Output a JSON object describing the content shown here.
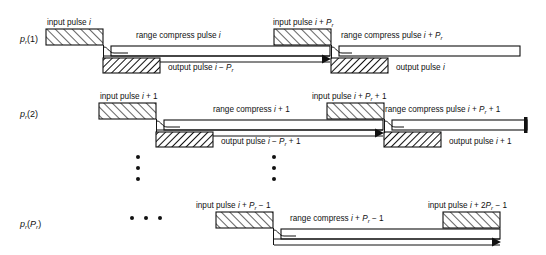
{
  "figure": {
    "title": "",
    "type": "radar-pulse-timing-diagram",
    "colors": {
      "stroke": "#111111",
      "background": "#ffffff",
      "hatch": "#111111"
    }
  },
  "rows": [
    {
      "id": "row-1",
      "label_main": "p",
      "label_sub": "r",
      "label_arg": "(1)",
      "input_pulses": [
        {
          "text_prefix": "input pulse ",
          "text_var": "i",
          "text_suffix": ""
        },
        {
          "text_prefix": "input pulse ",
          "text_var": "i",
          "text_suffix": " + P",
          "text_sub": "r"
        }
      ],
      "range_compress": [
        {
          "text": "range compress pulse ",
          "var": "i",
          "suffix": ""
        },
        {
          "text": "range compress pulse ",
          "var": "i",
          "suffix": " + P",
          "sub": "r"
        }
      ],
      "output_pulses": [
        {
          "text": "output pulse ",
          "var": "i",
          "suffix": " − P",
          "sub": "r"
        },
        {
          "text": "output pulse ",
          "var": "i",
          "suffix": ""
        }
      ]
    },
    {
      "id": "row-2",
      "label_main": "p",
      "label_sub": "r",
      "label_arg": "(2)",
      "input_pulses": [
        {
          "text_prefix": "input pulse ",
          "text_var": "i",
          "text_suffix": " + 1"
        },
        {
          "text_prefix": "input pulse ",
          "text_var": "i",
          "text_suffix": " + P",
          "text_sub": "r",
          "text_tail": " + 1"
        }
      ],
      "range_compress": [
        {
          "text": "range compress ",
          "var": "i",
          "suffix": " + 1"
        },
        {
          "text": "range compress pulse ",
          "var": "i",
          "suffix": " + P",
          "sub": "r",
          "tail": " + 1"
        }
      ],
      "output_pulses": [
        {
          "text": "output pulse ",
          "var": "i",
          "suffix": " − P",
          "sub": "r",
          "tail": " + 1"
        },
        {
          "text": "output pulse ",
          "var": "i",
          "suffix": " + 1"
        }
      ]
    },
    {
      "id": "row-3",
      "label_main": "p",
      "label_sub": "r",
      "label_arg": "(P",
      "label_arg_sub": "r",
      "label_arg_close": ")",
      "input_pulses": [
        {
          "text_prefix": "input pulse ",
          "text_var": "i",
          "text_suffix": " + P",
          "text_sub": "r",
          "text_tail": " − 1"
        },
        {
          "text_prefix": "input pulse ",
          "text_var": "i",
          "text_suffix": " + 2P",
          "text_sub": "r",
          "text_tail": " − 1"
        }
      ],
      "range_compress": [
        {
          "text": "range compress ",
          "var": "i",
          "suffix": " + P",
          "sub": "r",
          "tail": " − 1"
        }
      ],
      "output_pulses": []
    }
  ],
  "ellipsis": {
    "vertical_columns": [
      {
        "x": 138,
        "ys": [
          157,
          168,
          179
        ]
      },
      {
        "x": 274,
        "ys": [
          157,
          168,
          179
        ]
      }
    ],
    "horizontal_dots": {
      "y": 218,
      "xs": [
        132,
        146,
        160
      ]
    }
  },
  "text_strings": {
    "row1": {
      "input_left": "input pulse i",
      "input_right": "input pulse i + Pr",
      "rc_left": "range compress pulse i",
      "rc_right": "range compress pulse i + Pr",
      "out_left": "output pulse i − Pr",
      "out_right": "output pulse i"
    },
    "row2": {
      "input_left": "input pulse i + 1",
      "input_right": "input pulse i + Pr + 1",
      "rc_left": "range compress i + 1",
      "rc_right": "range compress pulse i + Pr + 1",
      "out_left": "output pulse i − Pr + 1",
      "out_right": "output pulse i + 1"
    },
    "row3": {
      "input_left": "input pulse i + Pr − 1",
      "input_right": "input pulse i + 2Pr − 1",
      "rc_left": "range compress i + Pr − 1"
    },
    "row_labels": [
      "pr(1)",
      "pr(2)",
      "pr(Pr)"
    ]
  }
}
